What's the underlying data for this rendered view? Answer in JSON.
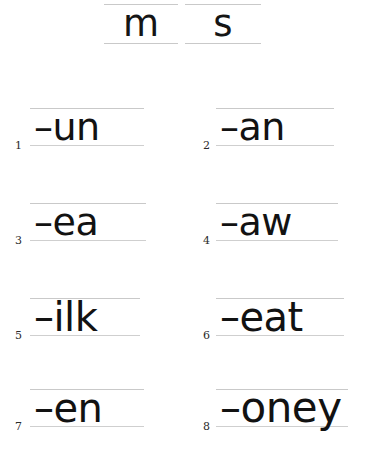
{
  "worksheet": {
    "background_color": "#ffffff",
    "text_color": "#121212",
    "rule_line_color": "#c9c9c9"
  },
  "header": {
    "name": "letter-bank",
    "letters": [
      {
        "glyph": "m"
      },
      {
        "glyph": "s"
      }
    ]
  },
  "items": [
    {
      "number": "1",
      "word": "–un"
    },
    {
      "number": "2",
      "word": "–an"
    },
    {
      "number": "3",
      "word": "–ea"
    },
    {
      "number": "4",
      "word": "–aw"
    },
    {
      "number": "5",
      "word": "–ilk"
    },
    {
      "number": "6",
      "word": "–eat"
    },
    {
      "number": "7",
      "word": "–en"
    },
    {
      "number": "8",
      "word": "–oney"
    }
  ]
}
